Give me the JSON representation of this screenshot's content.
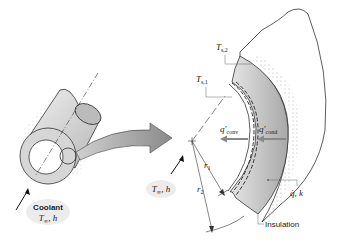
{
  "diagram": {
    "type": "cylindrical-wall-heat-transfer",
    "labels": {
      "coolant": "Coolant",
      "coolant_conditions": "T∞, h",
      "inner_fluid_conditions": "T∞, h",
      "surface_temp_outer": "Ts,2",
      "surface_temp_inner": "Ts,1",
      "q_conv": "q′conv",
      "q_cond": "q′cond",
      "radius_inner": "r1",
      "radius_outer": "r2",
      "generation_conductivity": "q̇, k",
      "insulation": "Insulation"
    },
    "colors": {
      "wall_fill": "#c8c8c8",
      "arrow_fill": "#9a9a9a",
      "line": "#333333"
    }
  }
}
